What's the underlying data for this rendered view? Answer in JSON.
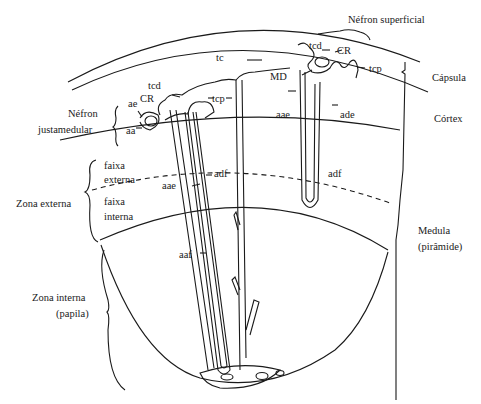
{
  "diagram": {
    "type": "anatomical-diagram",
    "colors": {
      "line": "#1a1a1a",
      "background": "#ffffff"
    },
    "labels": {
      "nefron_superficial": "Néfron superficial",
      "nefron_justamedular_1": "Néfron",
      "nefron_justamedular_2": "justamedular",
      "capsula": "Cápsula",
      "cortex": "Córtex",
      "medula_1": "Medula",
      "medula_2": "(pirâmide)",
      "zona_externa": "Zona externa",
      "faixa_externa_1": "faixa",
      "faixa_externa_2": "externa",
      "faixa_interna_1": "faixa",
      "faixa_interna_2": "interna",
      "zona_interna_1": "Zona interna",
      "zona_interna_2": "(papila)",
      "tc": "tc",
      "tcd_left": "tcd",
      "tcd_right": "tcd",
      "cr_left": "CR",
      "cr_right": "CR",
      "tcp_left": "tcp",
      "tcp_right": "tcp",
      "ae": "ae",
      "aa": "aa",
      "md": "MD",
      "aae_top": "aae",
      "ade": "ade",
      "adf_right": "adf",
      "aae_left": "aae",
      "adf_left": "adf",
      "aaf": "aaf"
    }
  }
}
